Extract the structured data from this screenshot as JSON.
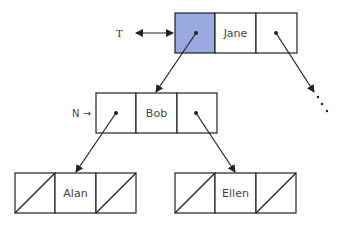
{
  "diagram": {
    "type": "binary-tree-linked-nodes",
    "highlight_color": "#9aa8e0",
    "line_color": "#222222",
    "labels": {
      "root_pointer": "T",
      "current_pointer": "N →"
    },
    "nodes": [
      {
        "id": "jane",
        "value": "Jane",
        "left": "pointer",
        "right": "pointer",
        "left_highlighted": true
      },
      {
        "id": "bob",
        "value": "Bob",
        "left": "pointer",
        "right": "pointer",
        "left_highlighted": false
      },
      {
        "id": "alan",
        "value": "Alan",
        "left": "null",
        "right": "null",
        "left_highlighted": false
      },
      {
        "id": "ellen",
        "value": "Ellen",
        "left": "null",
        "right": "null",
        "left_highlighted": false
      }
    ],
    "edges": [
      {
        "from": "jane.left",
        "to": "bob"
      },
      {
        "from": "jane.right",
        "to": "continuation"
      },
      {
        "from": "bob.left",
        "to": "alan"
      },
      {
        "from": "bob.right",
        "to": "ellen"
      }
    ],
    "continuation": "..."
  }
}
